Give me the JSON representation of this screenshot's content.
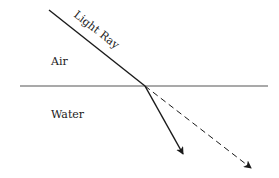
{
  "diagram": {
    "labels": {
      "ray": "Light Ray",
      "upper_medium": "Air",
      "lower_medium": "Water"
    },
    "geometry": {
      "interface": {
        "x1": 20,
        "y1": 86,
        "x2": 268,
        "y2": 86
      },
      "incident_ray": {
        "x1": 49,
        "y1": 10,
        "x2": 145,
        "y2": 86
      },
      "refracted_ray": {
        "x1": 145,
        "y1": 86,
        "x2": 183,
        "y2": 154
      },
      "undeviated_ray": {
        "x1": 145,
        "y1": 86,
        "x2": 251,
        "y2": 168
      }
    },
    "colors": {
      "line": "#1a1a1a",
      "interface": "#555555",
      "background": "#ffffff"
    }
  }
}
